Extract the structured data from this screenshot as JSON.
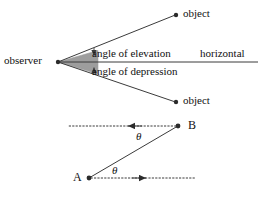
{
  "figure": {
    "title_text": "",
    "colors": {
      "stroke": "#3b3b3b",
      "wedge_fill": "#9d9d9d",
      "dot": "#2b2b2b",
      "text": "#111111",
      "background": "#ffffff"
    }
  },
  "upper_diagram": {
    "observer_label": "observer",
    "horizontal_label": "horizontal",
    "elevation_label": "angle of elevation",
    "depression_label": "angle of depression",
    "object_top_label": "object",
    "object_bottom_label": "object",
    "points": {
      "observer": {
        "x": 58,
        "y": 62
      },
      "object_top": {
        "x": 176,
        "y": 15
      },
      "object_bottom": {
        "x": 176,
        "y": 102
      },
      "horizontal_end": {
        "x": 258,
        "y": 62
      }
    }
  },
  "lower_diagram": {
    "point_a_label": "A",
    "point_b_label": "B",
    "angle_at_b_label": "θ",
    "angle_at_a_label": "θ",
    "points": {
      "a": {
        "x": 89,
        "y": 178
      },
      "b": {
        "x": 178,
        "y": 126
      }
    },
    "dotted_line_b": {
      "x_start": 178,
      "x_end": 68,
      "y": 126,
      "arrow_x": 130
    },
    "dotted_line_a": {
      "x_start": 89,
      "x_end": 196,
      "y": 178,
      "arrow_x": 146
    }
  }
}
